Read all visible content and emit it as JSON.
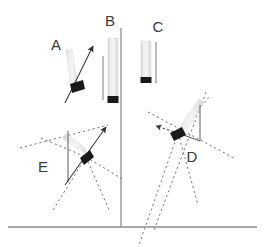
{
  "figure": {
    "title": "",
    "background_color": "#ffffff",
    "width": 264,
    "height": 247,
    "colors": {
      "baseline": "#8c8c8c",
      "axis_line": "#6e6e6e",
      "solid_line": "#4a4a4a",
      "dotted_line": "#7a7a7a",
      "bar_gray_light": "#f0f0f0",
      "bar_gray_mid": "#d6d6d6",
      "bar_gray_edge": "#bdbdbd",
      "marker_black": "#1a1a1a",
      "label_text": "#3a3a3a"
    },
    "baseline": {
      "name": "ground-baseline",
      "x1": 8,
      "y1": 227,
      "x2": 257,
      "y2": 227
    },
    "vertical_axis": {
      "name": "vertical-axis",
      "x1": 121,
      "y1": 28,
      "x2": 121,
      "y2": 227
    },
    "panels": [
      {
        "id": "A",
        "label": "A",
        "label_x": 56,
        "label_y": 50,
        "marker_x": 76,
        "marker_y": 88,
        "bar_angle_deg": 80,
        "bar_length": 42,
        "has_solid_arrow": true,
        "has_dotted_lines": false,
        "has_reference_line": false
      },
      {
        "id": "B",
        "label": "B",
        "label_x": 110,
        "label_y": 26,
        "marker_x": 111,
        "marker_y": 100,
        "bar_angle_deg": 90,
        "bar_length": 62,
        "has_solid_arrow": false,
        "has_dotted_lines": false,
        "has_reference_line": true
      },
      {
        "id": "C",
        "label": "C",
        "label_x": 158,
        "label_y": 32,
        "marker_x": 146,
        "marker_y": 81,
        "bar_angle_deg": 90,
        "bar_length": 40,
        "has_solid_arrow": false,
        "has_dotted_lines": false,
        "has_reference_line": true
      },
      {
        "id": "D",
        "label": "D",
        "label_x": 192,
        "label_y": 162,
        "marker_x": 178,
        "marker_y": 133,
        "bar_angle_deg": 58,
        "bar_length": 48,
        "has_solid_arrow": false,
        "has_dotted_lines": true,
        "has_reference_line": true
      },
      {
        "id": "E",
        "label": "E",
        "label_x": 43,
        "label_y": 172,
        "marker_x": 86,
        "marker_y": 157,
        "bar_angle_deg": 145,
        "bar_length": 42,
        "has_solid_arrow": true,
        "has_dotted_lines": true,
        "has_reference_line": true
      }
    ]
  }
}
